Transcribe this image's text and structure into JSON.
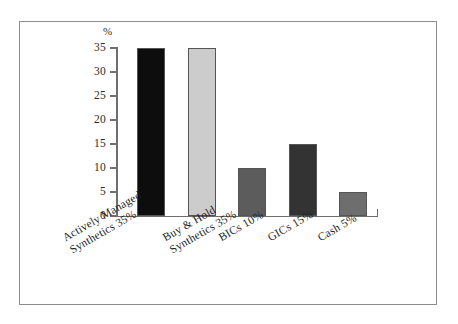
{
  "figure": {
    "frame_color": "#8d8d8d",
    "background": "#ffffff",
    "axis_color": "#6e6e6e"
  },
  "axis": {
    "unit_label": "%",
    "tick_labels": [
      "35",
      "30",
      "25",
      "20",
      "15",
      "10",
      "5",
      "0"
    ]
  },
  "chart_data": {
    "type": "bar",
    "title": "",
    "subtitle": "",
    "xlabel": "",
    "ylabel": "%",
    "ylim": [
      0,
      35
    ],
    "yticks": [
      0,
      5,
      10,
      15,
      20,
      25,
      30,
      35
    ],
    "grid": false,
    "legend": "none",
    "categories": [
      "Actively Managed\nSynthetics 35%",
      "Buy & Hold\nSynthetics 35%",
      "BICs 10%",
      "GICs 15%",
      "Cash 5%"
    ],
    "category_lines": [
      [
        "Actively Managed",
        "Synthetics 35%"
      ],
      [
        "Buy & Hold",
        "Synthetics 35%"
      ],
      [
        "BICs 10%",
        ""
      ],
      [
        "GICs 15%",
        ""
      ],
      [
        "Cash 5%",
        ""
      ]
    ],
    "values": [
      35,
      35,
      10,
      15,
      5
    ],
    "bar_colors": [
      "#0d0d0d",
      "#cccccc",
      "#5c5c5c",
      "#333333",
      "#6e6e6e"
    ],
    "bar_edge_color": "#555555"
  }
}
